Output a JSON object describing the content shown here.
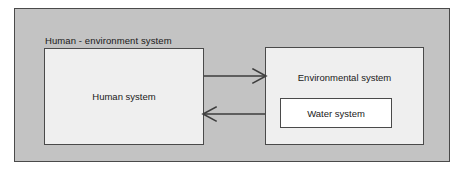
{
  "diagram": {
    "type": "block-diagram",
    "title": "Human - environment system",
    "outer": {
      "label": "Human - environment system",
      "fill_color": "#c3c3c3",
      "border_color": "#4a4a4a"
    },
    "nodes": [
      {
        "id": "human-system",
        "label": "Human system",
        "fill_color": "#efefef",
        "border_color": "#4a4a4a"
      },
      {
        "id": "environmental-system",
        "label": "Environmental system",
        "fill_color": "#efefef",
        "border_color": "#4a4a4a"
      },
      {
        "id": "water-system",
        "label": "Water system",
        "fill_color": "#ffffff",
        "border_color": "#4a4a4a",
        "parent": "environmental-system"
      }
    ],
    "connections": [
      {
        "id": "human-to-environment",
        "from": "human-system",
        "to": "environmental-system",
        "direction": "right",
        "style": "open-arrow"
      },
      {
        "id": "environment-to-human",
        "from": "environmental-system",
        "to": "human-system",
        "direction": "left",
        "style": "open-arrow"
      }
    ]
  }
}
